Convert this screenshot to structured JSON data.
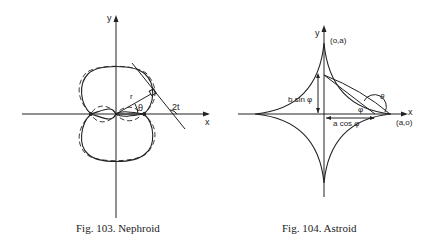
{
  "figures": [
    {
      "caption": "Fig. 103. Nephroid",
      "labels": {
        "x": "x",
        "y": "y",
        "r": "r",
        "theta": "θ",
        "angle": "2t"
      }
    },
    {
      "caption": "Fig. 104. Astroid",
      "labels": {
        "x": "x",
        "y": "y",
        "top": "(o,a)",
        "right": "(a,o)",
        "bsin": "b sin φ",
        "acos": "a cos φ",
        "phi": "φ",
        "theta": "θ"
      }
    }
  ]
}
